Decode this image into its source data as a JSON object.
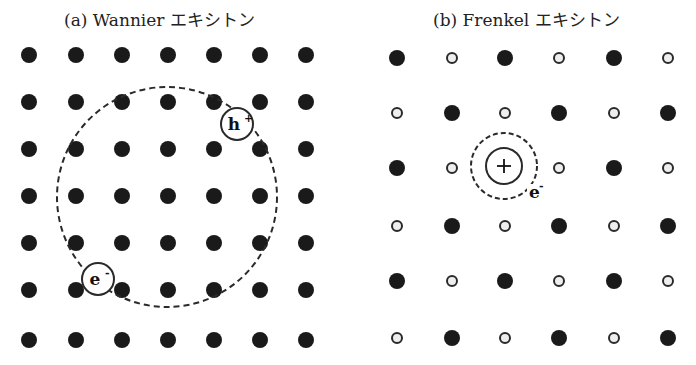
{
  "panels": [
    {
      "caption": "(a) Wannier エキシトン",
      "caption_x": 64,
      "lattice": {
        "xs": [
          29,
          76,
          122,
          168,
          214,
          260,
          306
        ],
        "ys": [
          55,
          102,
          149,
          196,
          243,
          290,
          340
        ],
        "dot_radius": 8,
        "pattern": "all-filled"
      },
      "orbit": {
        "cx": 167,
        "cy": 197,
        "r": 110,
        "style": "dashed"
      },
      "hole": {
        "label": "h",
        "sup": "+",
        "cx": 237,
        "cy": 124,
        "r": 16
      },
      "electron": {
        "label": "e",
        "sup": "-",
        "cx": 98,
        "cy": 279,
        "r": 16
      }
    },
    {
      "caption": "(b) Frenkel エキシトン",
      "caption_x": 433,
      "lattice": {
        "xs": [
          397,
          452,
          505,
          559,
          614,
          668
        ],
        "ys": [
          58,
          113,
          168,
          226,
          281,
          338
        ],
        "filled_radius": 8,
        "open_radius": 5,
        "pattern": "checkerboard-filled-open",
        "excited_site": [
          2,
          2
        ]
      },
      "excited_atom": {
        "cx": 504,
        "cy": 166,
        "r": 18,
        "symbol": "+"
      },
      "orbit": {
        "cx": 504,
        "cy": 166,
        "r": 33,
        "style": "dashed"
      },
      "electron_label": {
        "label": "e",
        "sup": "-",
        "x": 529,
        "y": 198
      }
    }
  ],
  "colors": {
    "dot": "#1a1a1a",
    "line": "#2a2a2a",
    "background": "#ffffff"
  }
}
